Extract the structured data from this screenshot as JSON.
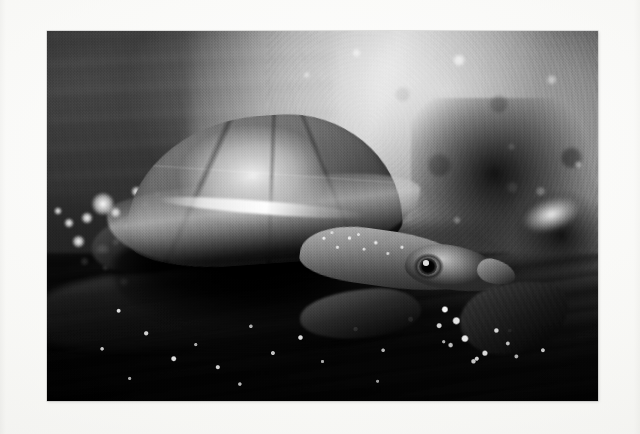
{
  "page": {
    "kind": "photograph",
    "background_color": "#f9f9f7",
    "caption": ""
  },
  "photograph": {
    "title": "Turtle on wet rock at water's edge",
    "medium": "black-and-white photograph",
    "frame": {
      "x": 47,
      "y": 31,
      "width": 551,
      "height": 370,
      "mat_color": "#f9f9f7",
      "edge_color": "#969696"
    },
    "subject": {
      "name": "turtle",
      "description": "A freshwater turtle with a smooth domed carapace rests on a wet rock, head and neck extended toward the lower right, one webbed foot splayed on the stone.",
      "parts": [
        {
          "name": "carapace",
          "tone": "mid grey with bright specular dome highlight"
        },
        {
          "name": "shell-rim",
          "tone": "bright lit marginal edge"
        },
        {
          "name": "neck",
          "tone": "pale grey, granular tubercles"
        },
        {
          "name": "head",
          "tone": "mid grey with dark eye"
        },
        {
          "name": "eye",
          "tone": "black pupil with pale ring"
        },
        {
          "name": "snout",
          "tone": "pale grey tip"
        },
        {
          "name": "front-flipper",
          "tone": "dark silhouette"
        },
        {
          "name": "webbed-foot",
          "tone": "dark with bright claw glints"
        },
        {
          "name": "rear-leg",
          "tone": "dark silhouette"
        }
      ]
    },
    "scene": {
      "regions": [
        {
          "name": "blurred-water",
          "position": "upper left",
          "tone": "dark grey, soft horizontal streaks"
        },
        {
          "name": "bokeh-highlights",
          "position": "left of centre",
          "tone": "bright round out-of-focus water sparkles"
        },
        {
          "name": "sunlit-rock",
          "position": "upper right",
          "tone": "bright mottled stone"
        },
        {
          "name": "dark-crevice",
          "position": "right of subject",
          "tone": "deep black lichen and shadow"
        },
        {
          "name": "white-lichen",
          "position": "far right middle",
          "tone": "bright white patch"
        },
        {
          "name": "foreground-rock",
          "position": "bottom",
          "tone": "dark wet stone with water droplet sparkles"
        }
      ],
      "bokeh_highlights": [
        {
          "x": 8.0,
          "y": 43.5,
          "size": 4.3
        },
        {
          "x": 6.2,
          "y": 49.0,
          "size": 2.2
        },
        {
          "x": 3.0,
          "y": 50.5,
          "size": 1.9
        },
        {
          "x": 1.2,
          "y": 47.5,
          "size": 1.5
        },
        {
          "x": 11.5,
          "y": 47.5,
          "size": 2.0
        },
        {
          "x": 13.8,
          "y": 51.5,
          "size": 1.7
        },
        {
          "x": 4.5,
          "y": 55.0,
          "size": 2.4
        },
        {
          "x": 8.8,
          "y": 57.2,
          "size": 2.6
        },
        {
          "x": 11.8,
          "y": 56.0,
          "size": 1.5
        },
        {
          "x": 6.0,
          "y": 61.0,
          "size": 1.6
        },
        {
          "x": 10.0,
          "y": 63.0,
          "size": 1.3
        },
        {
          "x": 15.2,
          "y": 41.8,
          "size": 2.1
        },
        {
          "x": 18.0,
          "y": 56.5,
          "size": 1.4
        },
        {
          "x": 17.0,
          "y": 46.0,
          "size": 1.3
        },
        {
          "x": 20.5,
          "y": 50.5,
          "size": 1.2
        },
        {
          "x": 23.0,
          "y": 59.0,
          "size": 1.1
        },
        {
          "x": 13.0,
          "y": 66.5,
          "size": 1.8
        },
        {
          "x": 19.5,
          "y": 43.0,
          "size": 1.2
        },
        {
          "x": 24.5,
          "y": 44.5,
          "size": 1.0
        },
        {
          "x": 26.5,
          "y": 48.5,
          "size": 1.1
        }
      ]
    }
  }
}
